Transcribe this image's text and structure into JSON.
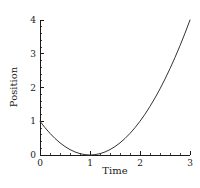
{
  "figure": {
    "background_color": "#ffffff",
    "line_color": "#333333",
    "axis_color": "#1a1a1a",
    "text_color": "#1a1a1a"
  },
  "chart_data": {
    "type": "line",
    "title": "",
    "xlabel": "Time",
    "ylabel": "Position",
    "xlim": [
      0,
      3
    ],
    "ylim": [
      0,
      4
    ],
    "grid": false,
    "legend": null,
    "xticks": [
      0,
      1,
      2,
      3
    ],
    "xtick_labels": [
      "0",
      "1",
      "2",
      "3"
    ],
    "yticks": [
      0,
      1,
      2,
      3,
      4
    ],
    "ytick_labels": [
      "0",
      "1",
      "2",
      "3",
      "4"
    ],
    "x_minor_tick_interval": 0.2,
    "y_minor_tick_interval": 0.2,
    "equation": "y = (t - 1)^2",
    "series": [
      {
        "name": "Position",
        "color": "#333333",
        "linewidth": 1,
        "x": [
          0,
          0.1,
          0.2,
          0.3,
          0.4,
          0.5,
          0.6,
          0.7,
          0.8,
          0.9,
          1.0,
          1.1,
          1.2,
          1.3,
          1.4,
          1.5,
          1.6,
          1.7,
          1.8,
          1.9,
          2.0,
          2.1,
          2.2,
          2.3,
          2.4,
          2.5,
          2.6,
          2.7,
          2.8,
          2.9,
          3.0
        ],
        "values": [
          1.0,
          0.81,
          0.64,
          0.49,
          0.36,
          0.25,
          0.16,
          0.09,
          0.04,
          0.01,
          0.0,
          0.01,
          0.04,
          0.09,
          0.16,
          0.25,
          0.36,
          0.49,
          0.64,
          0.81,
          1.0,
          1.21,
          1.44,
          1.69,
          1.96,
          2.25,
          2.56,
          2.89,
          3.24,
          3.61,
          4.0
        ]
      }
    ]
  }
}
